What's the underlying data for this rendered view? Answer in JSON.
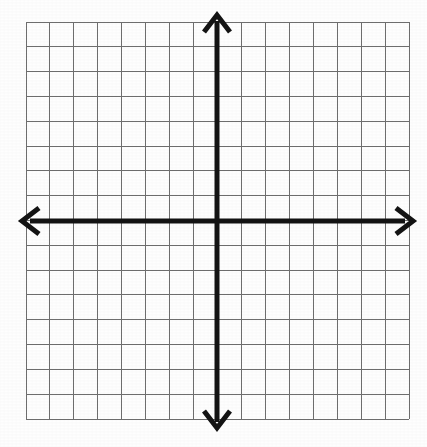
{
  "figure": {
    "background_color": "#fefefe"
  },
  "chart_data": {
    "type": "grid",
    "title": "",
    "subtitle": "",
    "xlabel": "",
    "ylabel": "",
    "series": [],
    "data_points": [],
    "annotations": [],
    "tick_labels": {
      "x": [],
      "y": []
    },
    "legend": {
      "entries": [],
      "position": "none"
    },
    "grid": {
      "visible": true,
      "columns": 16,
      "rows": 16,
      "cell_width_px": 23.95,
      "cell_height_px": 24.8,
      "line_color": "#6e6e6e",
      "line_width_px": 1,
      "left_px": 26,
      "top_px": 22,
      "right_px": 409,
      "bottom_px": 419
    },
    "axes": {
      "x_axis": {
        "label": "x-axis",
        "orientation": "horizontal",
        "position_y_px": 221,
        "start_px": 22,
        "end_px": 413,
        "color": "#141414",
        "line_width_px": 5,
        "arrow_start": true,
        "arrow_end": true,
        "range": [
          -8,
          8
        ],
        "visible_ticks": 16
      },
      "y_axis": {
        "label": "y-axis",
        "orientation": "vertical",
        "position_x_px": 217,
        "start_px": 15,
        "end_px": 428,
        "color": "#141414",
        "line_width_px": 5,
        "arrow_start": true,
        "arrow_end": true,
        "range": [
          -8,
          8
        ],
        "visible_ticks": 16
      },
      "origin": {
        "x_px": 217,
        "y_px": 221,
        "value": [
          0,
          0
        ]
      }
    },
    "quadrants": [
      {
        "name": "Quadrant I",
        "x_sign": "+",
        "y_sign": "+"
      },
      {
        "name": "Quadrant II",
        "x_sign": "-",
        "y_sign": "+"
      },
      {
        "name": "Quadrant III",
        "x_sign": "-",
        "y_sign": "-"
      },
      {
        "name": "Quadrant IV",
        "x_sign": "+",
        "y_sign": "-"
      }
    ],
    "colors": {
      "grid_line": "#6e6e6e",
      "axis_line": "#141414",
      "background": "#fefefe"
    }
  }
}
